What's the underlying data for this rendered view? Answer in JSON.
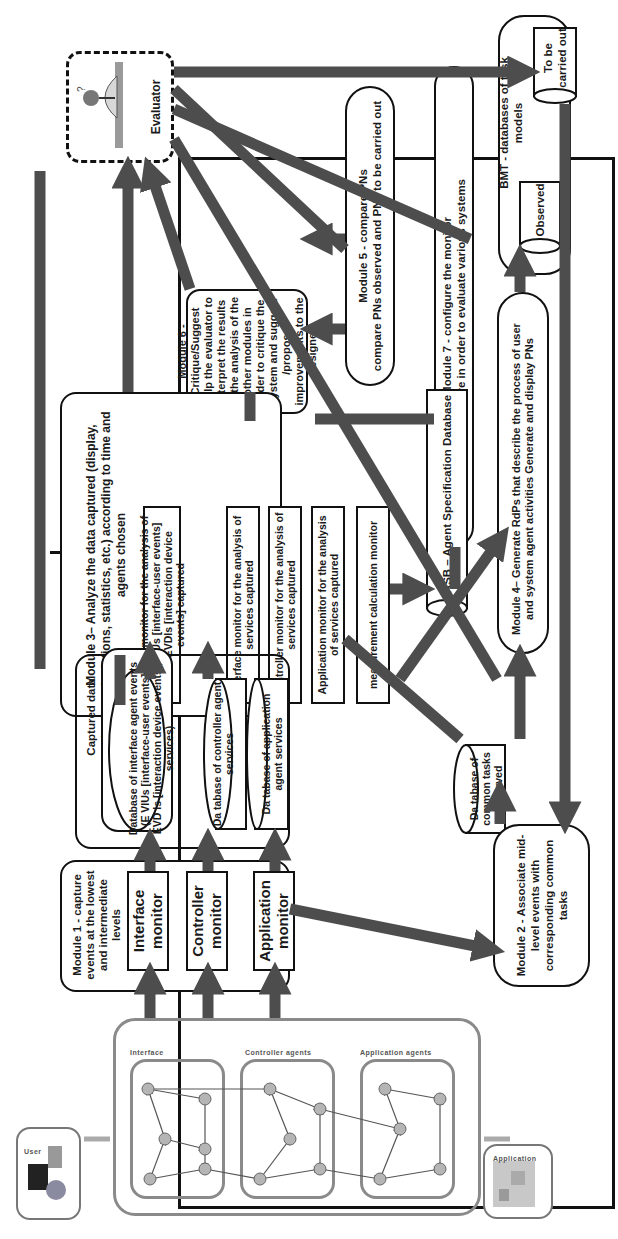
{
  "evaluator": {
    "label": "Evaluator"
  },
  "module1": {
    "title": "Module 1 - capture events at the lowest and intermediate levels",
    "monitors": [
      "Interface monitor",
      "Controller monitor",
      "Application monitor"
    ]
  },
  "captured_db": {
    "title": "Captured data database",
    "databases": [
      "Database of interface agent events (E VIUs [interface-user events], EVD Is [interaction device events], services)",
      "Da tabase of controller agent services",
      "Da tabase of application agent services"
    ]
  },
  "module2": {
    "title": "Module 2 - Associate mid-level events with corresponding common tasks"
  },
  "common_tasks_db": {
    "label": "Da tabase of common tasks observed"
  },
  "module3": {
    "title": "Module 3– Analyze the data captured (display, calculations, statistics, etc.) according to time and agents chosen",
    "monitors": [
      "Interface monitor for the analysis of the EVIUs [interface-user events] and EVDIs [interaction device events] captured",
      "Interface monitor for the analysis of services captured",
      "Controller monitor for the analysis of services captured",
      "Application monitor for the analysis of services captured",
      "measurement calculation monitor"
    ]
  },
  "asb": {
    "label": "ASB – Agent Specification Database"
  },
  "module4": {
    "title": "Module 4– Generate RdPs that describe the process of user and system agent activities Generate and display PNs"
  },
  "module5": {
    "title": "Module 5 - compare PNs",
    "body": "compare PNs observed and PNs to be carried out"
  },
  "module6": {
    "title": "Module 6 - Critique/Suggest",
    "body": "Help the evaluator to interpret the results of the analysis of the other modules in order to critique the system and suggest /propose improvements to the designer"
  },
  "module7": {
    "title": "Module 7 - configure the monitor",
    "body": "configure in order to evaluate various systems"
  },
  "bmt": {
    "title": "BMT - databases of task models",
    "databases": [
      "Observed",
      "To be carried out"
    ]
  },
  "system_under_test": {
    "layer_labels": [
      "Interface",
      "Controller agents",
      "Application agents"
    ],
    "user_label": "User",
    "application_label": "Application"
  },
  "colors": {
    "arrow": "#4d4d4d",
    "border": "#111111",
    "network": "#8a8a8a"
  }
}
